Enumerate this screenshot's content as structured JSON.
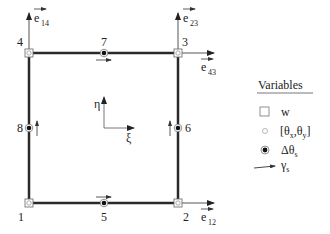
{
  "diagram": {
    "type": "quadrilateral-element",
    "nodes": [
      {
        "id": "1",
        "x": 29,
        "y": 203,
        "kind": "corner",
        "symbol": "square-with-circle"
      },
      {
        "id": "2",
        "x": 178,
        "y": 203,
        "kind": "corner",
        "symbol": "square-with-circle"
      },
      {
        "id": "3",
        "x": 178,
        "y": 53,
        "kind": "corner",
        "symbol": "square-with-circle"
      },
      {
        "id": "4",
        "x": 29,
        "y": 53,
        "kind": "corner",
        "symbol": "square-with-circle"
      },
      {
        "id": "5",
        "x": 104,
        "y": 203,
        "kind": "midside",
        "symbol": "filled-circle"
      },
      {
        "id": "6",
        "x": 178,
        "y": 128,
        "kind": "midside",
        "symbol": "filled-circle"
      },
      {
        "id": "7",
        "x": 104,
        "y": 53,
        "kind": "midside",
        "symbol": "filled-circle"
      },
      {
        "id": "8",
        "x": 29,
        "y": 128,
        "kind": "midside",
        "symbol": "filled-circle"
      }
    ],
    "vectors": [
      {
        "base": "e",
        "sub": "14",
        "at_node": "4",
        "direction": "up"
      },
      {
        "base": "e",
        "sub": "23",
        "at_node": "3",
        "direction": "up"
      },
      {
        "base": "e",
        "sub": "43",
        "at_node": "3",
        "direction": "right"
      },
      {
        "base": "e",
        "sub": "12",
        "at_node": "2",
        "direction": "right"
      }
    ],
    "axes": {
      "eta_label": "η",
      "xi_label": "ξ"
    },
    "legend": {
      "title": "Variables",
      "items": [
        {
          "symbol": "open-square",
          "label": "w"
        },
        {
          "symbol": "small-open-circle",
          "label_main": "[θ",
          "label_sub1": "x",
          "label_mid": ",θ",
          "label_sub2": "y",
          "label_end": "]"
        },
        {
          "symbol": "filled-circle",
          "label_main": "Δθ",
          "label_sub": "s"
        },
        {
          "symbol": "arrow",
          "label_main": "γ",
          "label_sub": "s"
        }
      ]
    },
    "colors": {
      "line": "#2a2a2a",
      "thin": "#555555",
      "node_fill": "#ffffff"
    }
  }
}
